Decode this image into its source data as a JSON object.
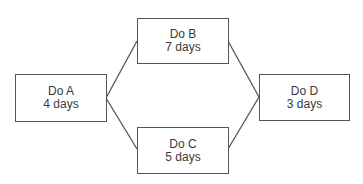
{
  "diagram": {
    "type": "activity-network",
    "line_color": "#555555",
    "text_color": "#3a3a3a",
    "nodes": [
      {
        "id": "A",
        "title": "Do A",
        "duration": "4 days",
        "x": 15,
        "y": 74,
        "w": 91,
        "h": 47
      },
      {
        "id": "B",
        "title": "Do B",
        "duration": "7 days",
        "x": 137,
        "y": 18,
        "w": 91,
        "h": 45
      },
      {
        "id": "C",
        "title": "Do C",
        "duration": "5 days",
        "x": 137,
        "y": 127,
        "w": 91,
        "h": 46
      },
      {
        "id": "D",
        "title": "Do D",
        "duration": "3 days",
        "x": 259,
        "y": 74,
        "w": 90,
        "h": 46
      }
    ],
    "edges": [
      {
        "from": "A",
        "to": "B",
        "x1": 106,
        "y1": 98,
        "x2": 137,
        "y2": 41
      },
      {
        "from": "A",
        "to": "C",
        "x1": 106,
        "y1": 98,
        "x2": 137,
        "y2": 149
      },
      {
        "from": "B",
        "to": "D",
        "x1": 228,
        "y1": 41,
        "x2": 259,
        "y2": 97
      },
      {
        "from": "C",
        "to": "D",
        "x1": 228,
        "y1": 149,
        "x2": 259,
        "y2": 97
      }
    ]
  }
}
